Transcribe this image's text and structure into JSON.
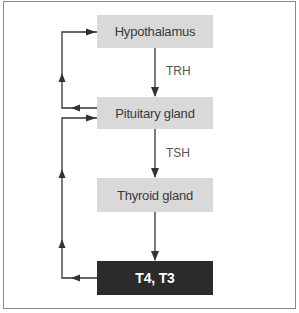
{
  "diagram": {
    "nodes": [
      {
        "id": "hypothalamus",
        "label": "Hypothalamus"
      },
      {
        "id": "pituitary",
        "label": "Pituitary gland"
      },
      {
        "id": "thyroid",
        "label": "Thyroid gland"
      },
      {
        "id": "hormones",
        "label": "T4, T3"
      }
    ],
    "edge_labels": {
      "trh": "TRH",
      "tsh": "TSH"
    },
    "edges": [
      {
        "from": "hypothalamus",
        "to": "pituitary",
        "label": "TRH",
        "type": "stimulation"
      },
      {
        "from": "pituitary",
        "to": "thyroid",
        "label": "TSH",
        "type": "stimulation"
      },
      {
        "from": "thyroid",
        "to": "hormones",
        "label": "",
        "type": "production"
      },
      {
        "from": "pituitary",
        "to": "hypothalamus",
        "label": "",
        "type": "feedback"
      },
      {
        "from": "hormones",
        "to": "pituitary",
        "label": "",
        "type": "feedback"
      }
    ],
    "colors": {
      "box_light": "#d9d9d9",
      "box_dark": "#2b2b2b",
      "line": "#333333",
      "frame": "#8a8a8a"
    }
  }
}
